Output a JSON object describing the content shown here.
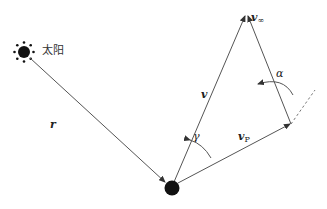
{
  "diagram": {
    "type": "velocity-vector-diagram",
    "labels": {
      "sun": "太阳",
      "position_vector": "r",
      "velocity": "v",
      "v_infinity_base": "v",
      "v_infinity_sub": "∞",
      "v_planet_base": "v",
      "v_planet_sub": "P",
      "angle_gamma": "γ",
      "angle_alpha": "α"
    },
    "nodes": [
      {
        "id": "sun",
        "label": "太阳",
        "x": 24,
        "y": 52
      },
      {
        "id": "planet",
        "x": 172,
        "y": 188
      },
      {
        "id": "apex",
        "x": 246,
        "y": 14
      },
      {
        "id": "vp_tip",
        "x": 291,
        "y": 124
      }
    ],
    "edges": [
      {
        "from": "sun",
        "to": "planet",
        "label": "r",
        "style": "solid-arrow"
      },
      {
        "from": "planet",
        "to": "apex",
        "label": "v",
        "style": "solid-arrow"
      },
      {
        "from": "vp_tip",
        "to": "apex",
        "label": "v∞",
        "style": "solid-arrow"
      },
      {
        "from": "planet",
        "to": "vp_tip",
        "label": "vP",
        "style": "solid-arrow"
      },
      {
        "from": "vp_tip",
        "to": "extension",
        "style": "dashed"
      }
    ],
    "colors": {
      "line": "#555555",
      "body": "#111111",
      "background": "#ffffff"
    }
  }
}
